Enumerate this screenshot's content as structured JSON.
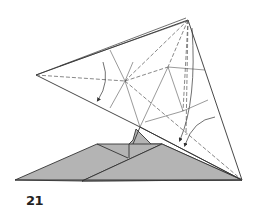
{
  "diagram": {
    "step_number": "21",
    "colors": {
      "paper_white": "#ffffff",
      "paper_grey": "#b4b4b4",
      "line": "#333333",
      "crease": "#555555"
    },
    "points": {
      "top_apex": [
        188,
        20
      ],
      "left_tip": [
        36,
        75
      ],
      "right_bottom": [
        242,
        180
      ],
      "center_node": [
        125,
        81
      ],
      "upper_right_node": [
        168,
        67
      ],
      "lower_right_node": [
        183,
        111
      ],
      "lower_edge_point": [
        140,
        127
      ]
    },
    "arrows": [
      {
        "name": "left-fold-arrow",
        "direction": "down"
      },
      {
        "name": "right-fold-arrow-1",
        "direction": "down"
      },
      {
        "name": "right-fold-arrow-2",
        "direction": "down"
      }
    ]
  }
}
